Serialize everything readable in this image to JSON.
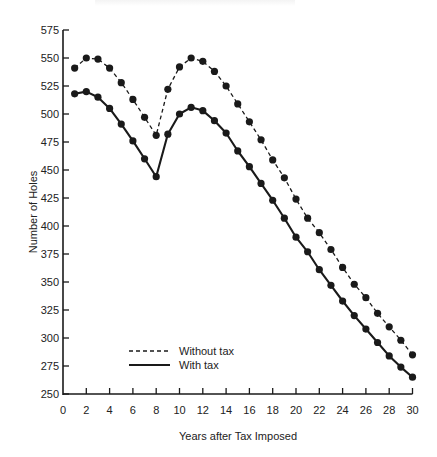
{
  "chart_data": {
    "type": "line",
    "title": "",
    "xlabel": "Years after Tax Imposed",
    "ylabel": "Number of Holes",
    "xlim": [
      0,
      30
    ],
    "ylim": [
      250,
      575
    ],
    "x_ticks": [
      0,
      2,
      4,
      6,
      8,
      10,
      12,
      14,
      16,
      18,
      20,
      22,
      24,
      26,
      28,
      30
    ],
    "y_ticks": [
      250,
      275,
      300,
      325,
      350,
      375,
      400,
      425,
      450,
      475,
      500,
      525,
      550,
      575
    ],
    "grid": false,
    "legend_position": "lower-left inside",
    "x": [
      1,
      2,
      3,
      4,
      5,
      6,
      7,
      8,
      9,
      10,
      11,
      12,
      13,
      14,
      15,
      16,
      17,
      18,
      19,
      20,
      21,
      22,
      23,
      24,
      25,
      26,
      27,
      28,
      29,
      30
    ],
    "series": [
      {
        "name": "Without tax",
        "style": "dashed",
        "marker": "filled-circle",
        "values": [
          541,
          550,
          549,
          541,
          528,
          513,
          497,
          481,
          522,
          542,
          550,
          547,
          538,
          525,
          509,
          493,
          477,
          459,
          443,
          424,
          407,
          394,
          379,
          363,
          348,
          336,
          322,
          310,
          298,
          285
        ]
      },
      {
        "name": "With tax",
        "style": "solid",
        "marker": "filled-circle",
        "values": [
          518,
          520,
          515,
          505,
          491,
          476,
          460,
          444,
          482,
          500,
          506,
          503,
          494,
          483,
          467,
          453,
          438,
          423,
          407,
          390,
          377,
          361,
          347,
          333,
          320,
          308,
          296,
          284,
          274,
          265
        ]
      }
    ]
  },
  "legend": {
    "items": [
      {
        "label": "Without tax",
        "style": "dashed"
      },
      {
        "label": "With tax",
        "style": "solid"
      }
    ]
  },
  "colors": {
    "ink": "#1a1a1a",
    "background": "#ffffff"
  }
}
